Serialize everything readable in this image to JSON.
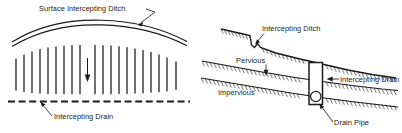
{
  "figure": {
    "title_visible": false,
    "background_color": "#ffffff",
    "ink_color": "#1a1a1a",
    "panels": [
      {
        "id": "plan-view",
        "name": "plan-view-panel",
        "labels": {
          "surface_ditch": "Surface Intercepting Ditch",
          "intercepting_drain": "Intercepting Drain"
        },
        "elements": {
          "ditch_curve": "double-arc",
          "flow_lines_count": 20,
          "flow_arrow_direction": "down",
          "drain_line_style": "dashed"
        }
      },
      {
        "id": "section-view",
        "name": "section-view-panel",
        "labels": {
          "intercepting_ditch": "Intercepting Ditch",
          "pervious": "Pervious",
          "impervious": "Impervious",
          "intercepting_drain": "Intercepting Drain",
          "drain_pipe": "Drain Pipe"
        },
        "elements": {
          "ground_surface": "sloping-hatched-line",
          "strata_boundary": "sloping-hatched-line",
          "trench": "vertical-rectangle",
          "pipe": "circle"
        }
      }
    ]
  }
}
